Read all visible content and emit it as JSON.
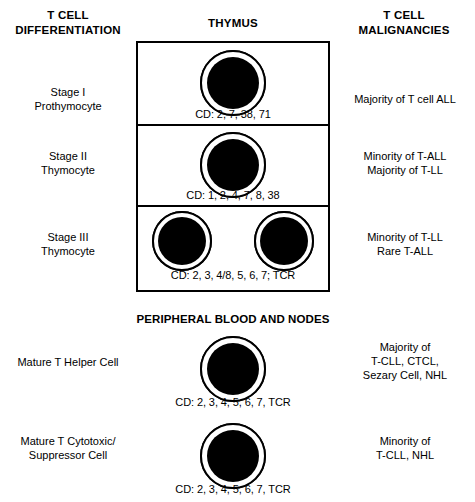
{
  "columns": {
    "left_header": "T CELL\nDIFFERENTIATION",
    "left_header_line1": "T CELL",
    "left_header_line2": "DIFFERENTIATION",
    "center_header": "THYMUS",
    "right_header_line1": "T CELL",
    "right_header_line2": "MALIGNANCIES"
  },
  "sections": {
    "thymus": {
      "title": "THYMUS",
      "boxed": true,
      "stages": [
        {
          "stage_label_line1": "Stage I",
          "stage_label_line2": "Prothymocyte",
          "cd_markers": "CD: 2, 7, 38, 71",
          "cell_count": 2,
          "malignancy_line1": "Majority of T cell ALL",
          "malignancy_line2": ""
        },
        {
          "stage_label_line1": "Stage II",
          "stage_label_line2": "Thymocyte",
          "cd_markers": "CD: 1, 2, 4, 7, 8, 38",
          "cell_count": 1,
          "malignancy_line1": "Minority of T-ALL",
          "malignancy_line2": "Majority of T-LL"
        },
        {
          "stage_label_line1": "Stage III",
          "stage_label_line2": "Thymocyte",
          "cd_markers": "CD: 2, 3, 4/8, 5, 6, 7; TCR",
          "cell_count": 2,
          "malignancy_line1": "Minority of T-LL",
          "malignancy_line2": "Rare T-ALL"
        }
      ]
    },
    "peripheral": {
      "title": "PERIPHERAL BLOOD AND NODES",
      "boxed": false,
      "stages": [
        {
          "stage_label_line1": "Mature T Helper Cell",
          "stage_label_line2": "",
          "cd_markers": "CD: 2, 3, 4, 5, 6, 7, TCR",
          "cell_count": 1,
          "malignancy_line1": "Majority of",
          "malignancy_line2": "T-CLL, CTCL,",
          "malignancy_line3": "Sezary Cell, NHL"
        },
        {
          "stage_label_line1": "Mature T Cytotoxic/",
          "stage_label_line2": "Suppressor Cell",
          "cd_markers": "CD: 2, 3, 4, 5, 6, 7, TCR",
          "cell_count": 1,
          "malignancy_line1": "Minority of",
          "malignancy_line2": "T-CLL, NHL",
          "malignancy_line3": ""
        }
      ]
    }
  },
  "colors": {
    "ink": "#000000",
    "background": "#ffffff",
    "cell_fill": "#000000",
    "cell_cytoplasm": "#ffffff"
  }
}
